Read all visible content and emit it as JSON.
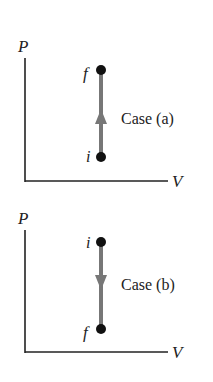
{
  "diagrams": [
    {
      "id": "case-a",
      "y_axis_label": "P",
      "x_axis_label": "V",
      "top_point_label": "f",
      "bottom_point_label": "i",
      "case_label": "Case (a)",
      "direction": "up"
    },
    {
      "id": "case-b",
      "y_axis_label": "P",
      "x_axis_label": "V",
      "top_point_label": "i",
      "bottom_point_label": "f",
      "case_label": "Case (b)",
      "direction": "down"
    }
  ],
  "colors": {
    "axis": "#222222",
    "path": "#777777",
    "point": "#111111",
    "text": "#222222"
  }
}
